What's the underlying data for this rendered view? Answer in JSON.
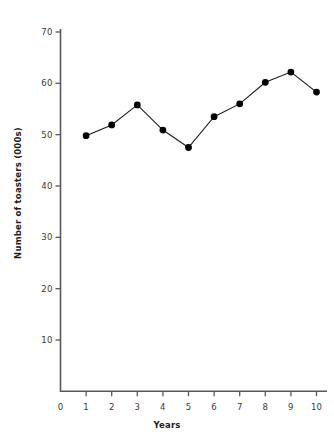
{
  "chart_data": {
    "type": "line",
    "title": "",
    "subtitle": "",
    "xlabel": "Years",
    "ylabel": "Number of toasters (000s)",
    "x": [
      1,
      2,
      3,
      4,
      5,
      6,
      7,
      8,
      9,
      10
    ],
    "values": [
      49.8,
      51.9,
      55.8,
      50.9,
      47.5,
      53.5,
      56.0,
      60.2,
      62.2,
      58.3
    ],
    "series": [
      {
        "name": "Number of toasters (000s)",
        "values": [
          49.8,
          51.9,
          55.8,
          50.9,
          47.5,
          53.5,
          56.0,
          60.2,
          62.2,
          58.3
        ]
      }
    ],
    "xlim": [
      0,
      10.4
    ],
    "ylim": [
      0,
      73
    ],
    "x_ticks": [
      0,
      1,
      2,
      3,
      4,
      5,
      6,
      7,
      8,
      9,
      10
    ],
    "x_tick_labels": [
      "0",
      "1",
      "2",
      "3",
      "4",
      "5",
      "6",
      "7",
      "8",
      "9",
      "10"
    ],
    "y_ticks": [
      10,
      20,
      30,
      40,
      50,
      60,
      70
    ],
    "y_tick_labels": [
      "10",
      "20",
      "30",
      "40",
      "50",
      "60",
      "70"
    ],
    "grid": false,
    "legend": false,
    "legend_position": "none",
    "marker": "filled-circle",
    "line_color": "#1a1a1a",
    "marker_color": "#000000",
    "axis_color": "#58595b",
    "background_color": "#ffffff"
  }
}
